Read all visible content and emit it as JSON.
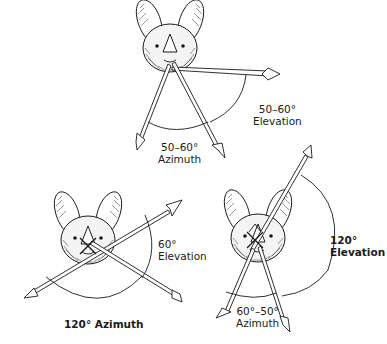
{
  "figure": {
    "panels": [
      {
        "id": "top",
        "elevation_label": {
          "value": "50–60°",
          "caption": "Elevation",
          "bold": false
        },
        "azimuth_label": {
          "value": "50–60°",
          "caption": "Azimuth",
          "bold": false
        }
      },
      {
        "id": "bottom-left",
        "elevation_label": {
          "value": "60°",
          "caption": "Elevation",
          "bold": false
        },
        "azimuth_label": {
          "text": "120° Azimuth",
          "bold": true
        }
      },
      {
        "id": "bottom-right",
        "elevation_label": {
          "value": "120°",
          "caption": "Elevation",
          "bold": true
        },
        "azimuth_label": {
          "value": "60°–50°",
          "caption": "Azimuth",
          "bold": false
        }
      }
    ],
    "colors": {
      "ink": "#1a1a1a",
      "background": "#ffffff"
    }
  }
}
